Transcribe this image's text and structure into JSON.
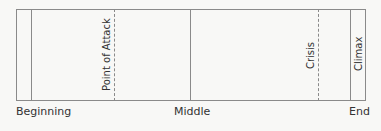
{
  "diagram": {
    "markers": [
      {
        "label": "Point of Attack",
        "style": "dashed",
        "x": 114
      },
      {
        "label": "Crisis",
        "style": "dashed",
        "x": 318
      },
      {
        "label": "Climax",
        "style": "solid",
        "x": 350
      }
    ],
    "bottom_labels": {
      "beginning": "Beginning",
      "middle": "Middle",
      "end": "End"
    }
  }
}
